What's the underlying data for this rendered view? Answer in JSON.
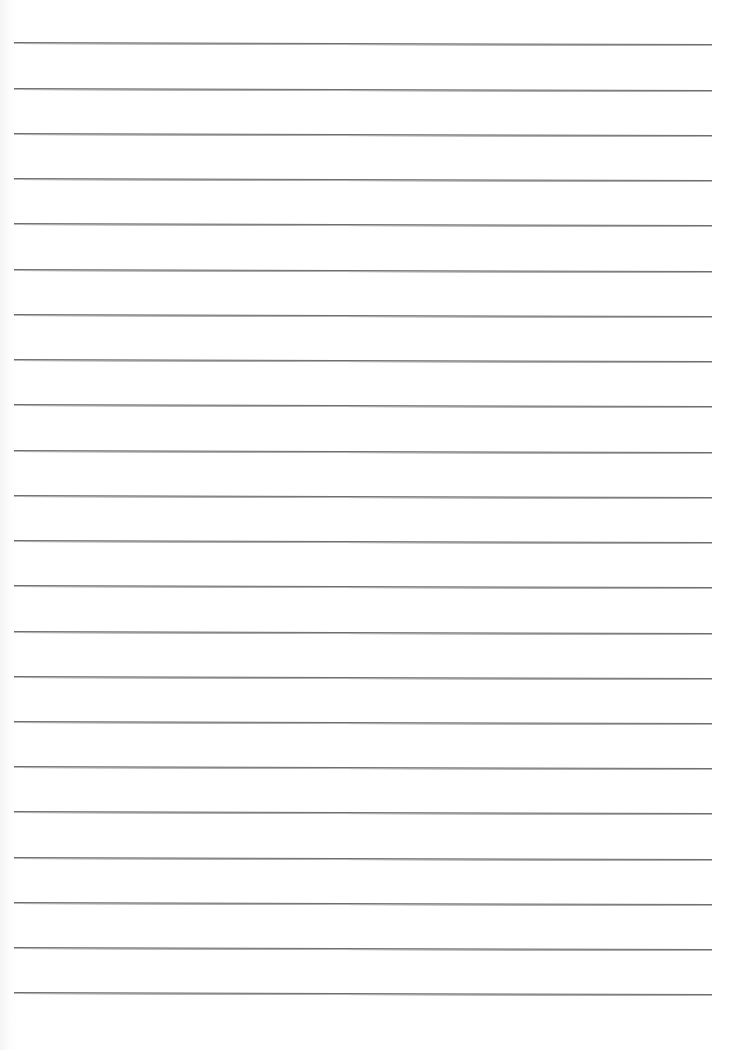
{
  "page": {
    "type": "lined-paper",
    "background_color": "#ffffff",
    "line_color": "#6e6e6e",
    "line_left_x": 14,
    "line_right_x": 712,
    "line_count": 22,
    "line_positions_y": [
      42,
      88,
      133,
      178,
      223,
      269,
      314,
      359,
      404,
      450,
      495,
      540,
      585,
      631,
      676,
      721,
      766,
      811,
      857,
      902,
      947,
      992
    ]
  }
}
